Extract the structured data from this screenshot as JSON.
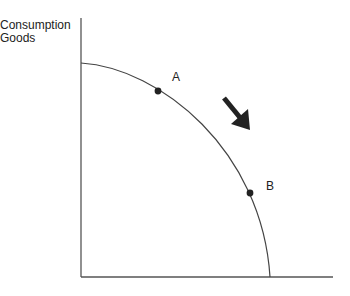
{
  "chart_data": {
    "type": "line",
    "ylabel": "Consumption Goods",
    "xlabel": "",
    "grid": false,
    "axes": {
      "origin": [
        81,
        277
      ],
      "x_end": [
        333,
        277
      ],
      "y_end": [
        81,
        18
      ]
    },
    "curve": {
      "description": "Concave (bowed-out) production possibilities curve",
      "start": [
        81,
        63
      ],
      "end": [
        270,
        277
      ],
      "path": "M81,63 C160,68 262,150 270,277"
    },
    "points": [
      {
        "label": "A",
        "x": 158,
        "y": 91,
        "label_x": 174,
        "label_y": 81
      },
      {
        "label": "B",
        "x": 250,
        "y": 193,
        "label_x": 267,
        "label_y": 190
      }
    ],
    "annotations": [
      {
        "type": "arrow",
        "direction": "down-right",
        "from": [
          224,
          98
        ],
        "to": [
          248,
          128
        ],
        "meaning": "movement from A toward B along the curve"
      }
    ]
  },
  "labels": {
    "y_axis_line1": "Consumption",
    "y_axis_line2": "Goods"
  },
  "colors": {
    "axis": "#555555",
    "curve": "#444444",
    "point": "#222222",
    "arrow": "#222222"
  }
}
